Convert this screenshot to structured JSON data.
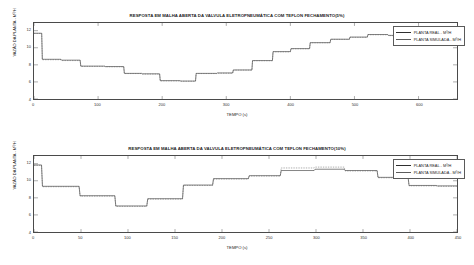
{
  "charts": [
    {
      "title": "RESPOSTA EM MALHA ABERTA DA VALVULA ELETROPNEUMÁTICA COM TEFLON FECHAMENTO(5%)",
      "xlabel": "TEMPO (s)",
      "ylabel": "VAZÃO DA PLANTA - M³/H",
      "legend": [
        {
          "label": "PLANTA REAL - M³/H",
          "color": "#2f2f2f"
        },
        {
          "label": "PLANTA SIMULADA - M³/H",
          "color": "#5c5c5c"
        }
      ],
      "xticks": [
        "0",
        "100",
        "200",
        "300",
        "400",
        "500",
        "600"
      ],
      "yticks": [
        "12",
        "10",
        "8",
        "6",
        "4"
      ]
    },
    {
      "title": "RESPOSTA EM MALHA ABERTA DA VALVULA ELETROPNEUMÁTICA COM TEFLON FECHAMENTO(10%)",
      "xlabel": "TEMPO (s)",
      "ylabel": "VAZÃO DA PLANTA - M³/H",
      "legend": [
        {
          "label": "PLANTA REAL - M³/H",
          "color": "#2f2f2f"
        },
        {
          "label": "PLANTA SIMULADA - M³/H",
          "color": "#5c5c5c"
        }
      ],
      "xticks": [
        "0",
        "50",
        "100",
        "150",
        "200",
        "250",
        "300",
        "350",
        "400",
        "450"
      ],
      "yticks": [
        "12",
        "10",
        "8",
        "6",
        "4"
      ]
    }
  ],
  "chart_data": [
    {
      "type": "line",
      "title": "RESPOSTA EM MALHA ABERTA DA VALVULA ELETROPNEUMÁTICA COM TEFLON FECHAMENTO(5%)",
      "xlabel": "TEMPO (s)",
      "ylabel": "VAZÃO DA PLANTA - M³/H",
      "xlim": [
        0,
        660
      ],
      "ylim": [
        4,
        12.9
      ],
      "xticks": [
        0,
        100,
        200,
        300,
        400,
        500,
        600
      ],
      "yticks": [
        4,
        6,
        8,
        10,
        12
      ],
      "grid": false,
      "legend_position": "top-right",
      "series": [
        {
          "name": "PLANTA REAL - M³/H",
          "color": "#2f2f2f",
          "style": "step",
          "x": [
            0,
            12,
            13,
            42,
            43,
            72,
            73,
            110,
            111,
            140,
            141,
            168,
            169,
            196,
            197,
            228,
            229,
            252,
            253,
            285,
            286,
            310,
            311,
            340,
            341,
            372,
            373,
            400,
            401,
            430,
            431,
            462,
            463,
            492,
            493,
            520,
            521,
            552,
            553,
            580,
            581,
            612,
            613,
            660
          ],
          "y": [
            11.7,
            11.7,
            8.65,
            8.65,
            8.55,
            8.55,
            7.85,
            7.85,
            7.8,
            7.8,
            7.0,
            7.0,
            6.95,
            6.95,
            6.15,
            6.15,
            6.1,
            6.1,
            7.0,
            7.0,
            7.05,
            7.05,
            7.4,
            7.4,
            8.5,
            8.5,
            9.55,
            9.55,
            9.9,
            9.9,
            10.6,
            10.6,
            11.0,
            11.0,
            11.25,
            11.25,
            11.55,
            11.55,
            11.45,
            11.45,
            11.25,
            11.25,
            10.5,
            10.6
          ]
        },
        {
          "name": "PLANTA SIMULADA - M³/H",
          "color": "#5c5c5c",
          "style": "step",
          "x": [
            0,
            12,
            13,
            42,
            43,
            72,
            73,
            110,
            111,
            140,
            141,
            168,
            169,
            196,
            197,
            228,
            229,
            252,
            253,
            285,
            286,
            310,
            311,
            340,
            341,
            372,
            373,
            400,
            401,
            430,
            431,
            462,
            463,
            492,
            493,
            520,
            521,
            552,
            553,
            580,
            581,
            612,
            613,
            660
          ],
          "y": [
            11.68,
            11.68,
            8.6,
            8.6,
            8.5,
            8.5,
            7.82,
            7.82,
            7.77,
            7.77,
            6.98,
            6.98,
            6.92,
            6.92,
            6.12,
            6.12,
            6.08,
            6.08,
            6.98,
            6.98,
            7.02,
            7.02,
            7.38,
            7.38,
            8.48,
            8.48,
            9.52,
            9.52,
            9.88,
            9.88,
            10.58,
            10.58,
            10.98,
            10.98,
            11.22,
            11.22,
            11.52,
            11.52,
            11.42,
            11.42,
            11.22,
            11.22,
            10.48,
            10.58
          ]
        }
      ]
    },
    {
      "type": "line",
      "title": "RESPOSTA EM MALHA ABERTA DA VALVULA ELETROPNEUMÁTICA COM TEFLON FECHAMENTO(10%)",
      "xlabel": "TEMPO (s)",
      "ylabel": "VAZÃO DA PLANTA - M³/H",
      "xlim": [
        0,
        450
      ],
      "ylim": [
        4,
        12.9
      ],
      "xticks": [
        0,
        50,
        100,
        150,
        200,
        250,
        300,
        350,
        400,
        450
      ],
      "yticks": [
        4,
        6,
        8,
        10,
        12
      ],
      "grid": false,
      "legend_position": "top-right",
      "series": [
        {
          "name": "PLANTA REAL - M³/H",
          "color": "#2f2f2f",
          "style": "step",
          "x": [
            0,
            8,
            9,
            48,
            49,
            86,
            87,
            120,
            121,
            158,
            159,
            190,
            191,
            228,
            229,
            262,
            263,
            298,
            299,
            330,
            331,
            365,
            366,
            398,
            399,
            428,
            429,
            450
          ],
          "y": [
            11.85,
            11.85,
            9.35,
            9.35,
            8.25,
            8.25,
            7.05,
            7.05,
            7.9,
            7.9,
            9.5,
            9.5,
            10.25,
            10.25,
            10.6,
            10.6,
            11.2,
            11.2,
            11.35,
            11.35,
            11.2,
            11.2,
            10.4,
            10.4,
            9.45,
            9.45,
            9.4,
            9.4
          ]
        },
        {
          "name": "PLANTA SIMULADA - M³/H",
          "color": "#5c5c5c",
          "style": "step",
          "x": [
            0,
            8,
            9,
            48,
            49,
            86,
            87,
            120,
            121,
            158,
            159,
            190,
            191,
            228,
            229,
            262,
            263,
            298,
            299,
            330,
            331,
            365,
            366,
            398,
            399,
            428,
            429,
            450
          ],
          "y": [
            11.8,
            11.8,
            9.3,
            9.3,
            8.2,
            8.2,
            7.0,
            7.0,
            7.85,
            7.85,
            9.45,
            9.45,
            10.2,
            10.2,
            10.55,
            10.55,
            11.5,
            11.5,
            11.6,
            11.6,
            11.15,
            11.15,
            10.35,
            10.35,
            9.4,
            9.4,
            9.35,
            9.35
          ]
        }
      ]
    }
  ]
}
